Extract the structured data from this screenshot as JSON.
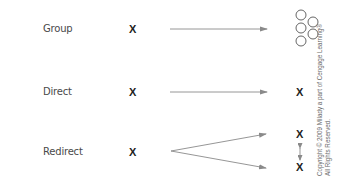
{
  "rows": [
    {
      "label": "Group",
      "source_mark": "X",
      "target_type": "group-of-circles",
      "target_circles": 6
    },
    {
      "label": "Direct",
      "source_mark": "X",
      "target_type": "single-mark",
      "target_mark": "X"
    },
    {
      "label": "Redirect",
      "source_mark": "X",
      "target_type": "two-marks-linked",
      "target_marks": [
        "X",
        "X"
      ]
    }
  ],
  "copyright": {
    "line1": "Copyright © 2009 Milady a part of Cengage Learning®",
    "line2": "All Rights Reserved."
  },
  "colors": {
    "arrow": "#8a8a8a",
    "text": "#4a4a4a",
    "mark": "#222222",
    "circle": "#555555"
  }
}
